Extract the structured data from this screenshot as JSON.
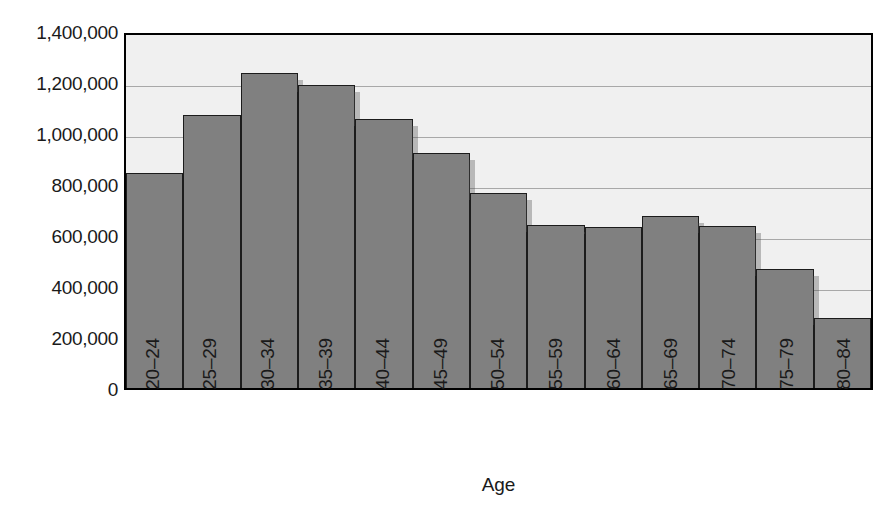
{
  "chart_data": {
    "type": "bar",
    "title": "",
    "xlabel": "Age",
    "ylabel": "Number of licensed drivers",
    "categories": [
      "20–24",
      "25–29",
      "30–34",
      "35–39",
      "40–44",
      "45–49",
      "50–54",
      "55–59",
      "60–64",
      "65–69",
      "70–74",
      "75–79",
      "80–84"
    ],
    "values": [
      845000,
      1070000,
      1235000,
      1190000,
      1055000,
      920000,
      765000,
      640000,
      630000,
      675000,
      635000,
      465000,
      275000
    ],
    "ylim": [
      0,
      1400000
    ],
    "ytick_values": [
      0,
      200000,
      400000,
      600000,
      800000,
      1000000,
      1200000,
      1400000
    ],
    "ytick_labels": [
      "0",
      "200,000",
      "400,000",
      "600,000",
      "800,000",
      "1,000,000",
      "1,200,000",
      "1,400,000"
    ],
    "grid": true,
    "gridlines_axis": "y",
    "legend": null,
    "bar_color": "#808080",
    "bar_edge_color": "#1c1c1c",
    "plot_background": "#f0f0f0",
    "gridline_color": "#a8a8a8",
    "axis_color": "#000000",
    "bar_gap": 0
  }
}
